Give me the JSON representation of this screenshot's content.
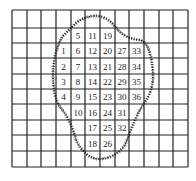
{
  "grid": {
    "cols": 12,
    "rows": 10,
    "x_lines": [
      12,
      27,
      41,
      56,
      71,
      85,
      100,
      115,
      129,
      144,
      159,
      173,
      188
    ],
    "y_lines": [
      10,
      28,
      43,
      58,
      74,
      89,
      104,
      120,
      135,
      151,
      167
    ],
    "line_color": "#222222"
  },
  "cells": [
    {
      "row": 1,
      "col": 4,
      "value": "5"
    },
    {
      "row": 1,
      "col": 5,
      "value": "11"
    },
    {
      "row": 1,
      "col": 6,
      "value": "19"
    },
    {
      "row": 2,
      "col": 3,
      "value": "1"
    },
    {
      "row": 2,
      "col": 4,
      "value": "6"
    },
    {
      "row": 2,
      "col": 5,
      "value": "12"
    },
    {
      "row": 2,
      "col": 6,
      "value": "20"
    },
    {
      "row": 2,
      "col": 7,
      "value": "27"
    },
    {
      "row": 2,
      "col": 8,
      "value": "33"
    },
    {
      "row": 3,
      "col": 3,
      "value": "2"
    },
    {
      "row": 3,
      "col": 4,
      "value": "7"
    },
    {
      "row": 3,
      "col": 5,
      "value": "13"
    },
    {
      "row": 3,
      "col": 6,
      "value": "21"
    },
    {
      "row": 3,
      "col": 7,
      "value": "28"
    },
    {
      "row": 3,
      "col": 8,
      "value": "34"
    },
    {
      "row": 4,
      "col": 3,
      "value": "3"
    },
    {
      "row": 4,
      "col": 4,
      "value": "8"
    },
    {
      "row": 4,
      "col": 5,
      "value": "14"
    },
    {
      "row": 4,
      "col": 6,
      "value": "22"
    },
    {
      "row": 4,
      "col": 7,
      "value": "29"
    },
    {
      "row": 4,
      "col": 8,
      "value": "35"
    },
    {
      "row": 5,
      "col": 3,
      "value": "4"
    },
    {
      "row": 5,
      "col": 4,
      "value": "9"
    },
    {
      "row": 5,
      "col": 5,
      "value": "15"
    },
    {
      "row": 5,
      "col": 6,
      "value": "23"
    },
    {
      "row": 5,
      "col": 7,
      "value": "30"
    },
    {
      "row": 5,
      "col": 8,
      "value": "36"
    },
    {
      "row": 6,
      "col": 4,
      "value": "10"
    },
    {
      "row": 6,
      "col": 5,
      "value": "16"
    },
    {
      "row": 6,
      "col": 6,
      "value": "24"
    },
    {
      "row": 6,
      "col": 7,
      "value": "31"
    },
    {
      "row": 7,
      "col": 5,
      "value": "17"
    },
    {
      "row": 7,
      "col": 6,
      "value": "25"
    },
    {
      "row": 7,
      "col": 7,
      "value": "32"
    },
    {
      "row": 8,
      "col": 5,
      "value": "18"
    },
    {
      "row": 8,
      "col": 6,
      "value": "26"
    }
  ],
  "outline": {
    "shape": "irregular-region-boundary",
    "style": "hatched-dashed",
    "color": "#222222"
  }
}
